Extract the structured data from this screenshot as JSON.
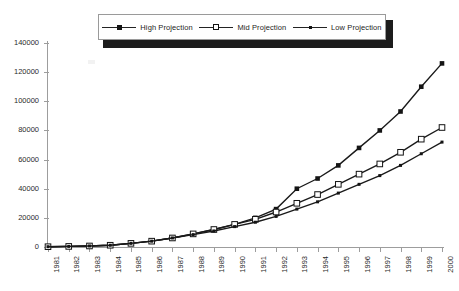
{
  "legend": {
    "position": "top-center",
    "entries": [
      {
        "label": "High Projection",
        "marker": "filled-square-marker",
        "color": "#1a1a1a"
      },
      {
        "label": "Mid Projection",
        "marker": "open-square-marker",
        "color": "#1a1a1a"
      },
      {
        "label": "Low Projection",
        "marker": "small-filled-square-marker",
        "color": "#1a1a1a"
      }
    ]
  },
  "axes": {
    "y_ticks": [
      "140000",
      "120000",
      "100000",
      "80000",
      "60000",
      "40000",
      "20000",
      "0"
    ],
    "x_ticks": [
      "1981",
      "1982",
      "1983",
      "1984",
      "1985",
      "1986",
      "1987",
      "1988",
      "1989",
      "1990",
      "1991",
      "1992",
      "1993",
      "1994",
      "1995",
      "1996",
      "1997",
      "1998",
      "1999",
      "2000"
    ]
  },
  "chart_data": {
    "type": "line",
    "title": "",
    "subtitle": "",
    "xlabel": "",
    "ylabel": "",
    "grid": false,
    "legend_position": "top-center",
    "ylim": [
      0,
      140000
    ],
    "ytick_step": 20000,
    "categories": [
      "1981",
      "1982",
      "1983",
      "1984",
      "1985",
      "1986",
      "1987",
      "1988",
      "1989",
      "1990",
      "1991",
      "1992",
      "1993",
      "1994",
      "1995",
      "1996",
      "1997",
      "1998",
      "1999",
      "2000"
    ],
    "series": [
      {
        "name": "High Projection",
        "marker": "filled-square",
        "color": "#1a1a1a",
        "values": [
          200,
          400,
          700,
          1200,
          2500,
          4000,
          6200,
          9000,
          12000,
          15500,
          20000,
          26000,
          40000,
          47000,
          56000,
          68000,
          80000,
          93000,
          110000,
          126000
        ]
      },
      {
        "name": "Mid Projection",
        "marker": "open-square",
        "color": "#1a1a1a",
        "values": [
          200,
          400,
          700,
          1200,
          2500,
          4000,
          6200,
          9000,
          12000,
          15500,
          19000,
          24000,
          30000,
          36000,
          43000,
          50000,
          57000,
          65000,
          74000,
          82000
        ]
      },
      {
        "name": "Low Projection",
        "marker": "small-filled-square",
        "color": "#1a1a1a",
        "values": [
          200,
          400,
          700,
          1200,
          2500,
          4000,
          6200,
          8500,
          11000,
          14000,
          17000,
          21000,
          26000,
          31000,
          37000,
          43000,
          49000,
          56000,
          64000,
          72000
        ]
      }
    ]
  }
}
